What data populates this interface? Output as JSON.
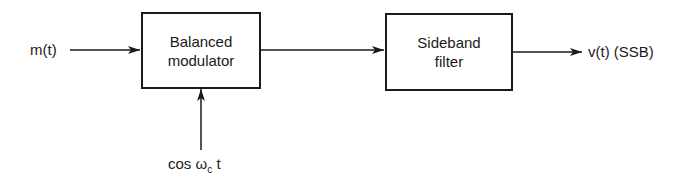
{
  "diagram": {
    "input_label": "m(t)",
    "carrier_label_prefix": "cos ω",
    "carrier_label_sub": "c",
    "carrier_label_suffix": " t",
    "output_label": "v(t) (SSB)",
    "blocks": [
      {
        "id": "balanced-modulator",
        "line1": "Balanced",
        "line2": "modulator"
      },
      {
        "id": "sideband-filter",
        "line1": "Sideband",
        "line2": "filter"
      }
    ],
    "edges": [
      {
        "from": "m(t)",
        "to": "balanced-modulator"
      },
      {
        "from": "cos ωc t",
        "to": "balanced-modulator"
      },
      {
        "from": "balanced-modulator",
        "to": "sideband-filter"
      },
      {
        "from": "sideband-filter",
        "to": "v(t) (SSB)"
      }
    ],
    "colors": {
      "stroke": "#1a1a1a",
      "background": "#ffffff"
    }
  }
}
